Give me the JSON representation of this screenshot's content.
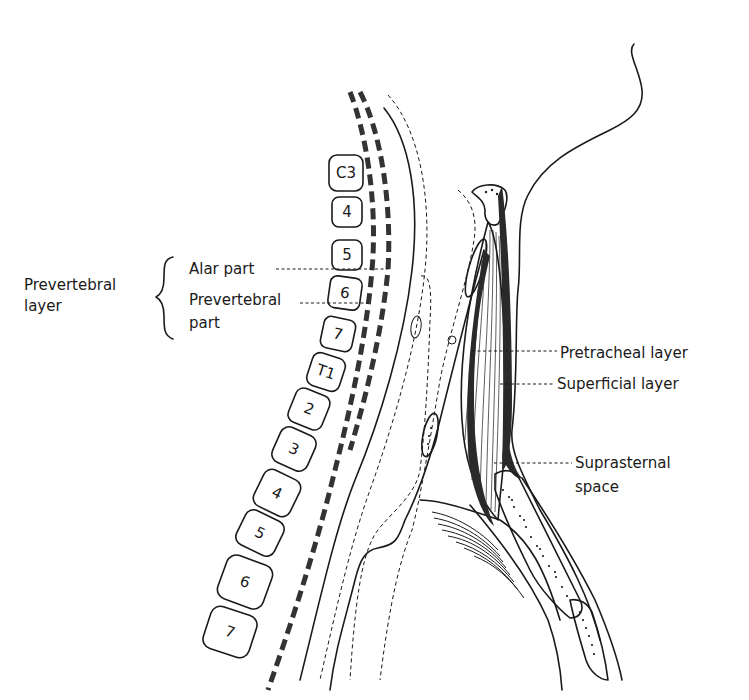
{
  "figure": {
    "colors": {
      "ink": "#1a1a1a",
      "background": "#ffffff",
      "fascia_dash": "#333333"
    }
  },
  "labels": {
    "prevertebral_layer": {
      "line1": "Prevertebral",
      "line2": "layer"
    },
    "alar_part": "Alar part",
    "prevertebral_part": {
      "line1": "Prevertebral",
      "line2": "part"
    },
    "pretracheal_layer": "Pretracheal layer",
    "superficial_layer": "Superficial layer",
    "suprasternal_space": {
      "line1": "Suprasternal",
      "line2": "space"
    }
  },
  "vertebrae": [
    {
      "label": "C3",
      "x": 346,
      "y": 173,
      "w": 34,
      "h": 36,
      "rot": 0
    },
    {
      "label": "4",
      "x": 346,
      "y": 212,
      "w": 30,
      "h": 30,
      "rot": 0
    },
    {
      "label": "5",
      "x": 346,
      "y": 255,
      "w": 30,
      "h": 30,
      "rot": 0
    },
    {
      "label": "6",
      "x": 344,
      "y": 293,
      "w": 32,
      "h": 32,
      "rot": 8
    },
    {
      "label": "7",
      "x": 337,
      "y": 334,
      "w": 32,
      "h": 32,
      "rot": 12
    },
    {
      "label": "T1",
      "x": 326,
      "y": 372,
      "w": 34,
      "h": 34,
      "rot": 18
    },
    {
      "label": "2",
      "x": 309,
      "y": 409,
      "w": 36,
      "h": 36,
      "rot": 22
    },
    {
      "label": "3",
      "x": 294,
      "y": 449,
      "w": 38,
      "h": 38,
      "rot": 24
    },
    {
      "label": "4",
      "x": 277,
      "y": 493,
      "w": 40,
      "h": 40,
      "rot": 26
    },
    {
      "label": "5",
      "x": 259,
      "y": 532,
      "w": 42,
      "h": 38,
      "rot": 26
    },
    {
      "label": "6",
      "x": 245,
      "y": 582,
      "w": 48,
      "h": 46,
      "rot": 20
    },
    {
      "label": "7",
      "x": 228,
      "y": 631,
      "w": 48,
      "h": 44,
      "rot": 18
    }
  ]
}
